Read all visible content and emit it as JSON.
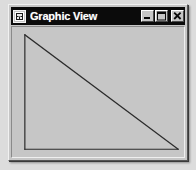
{
  "page": {
    "background_color": "#dcdcdc",
    "width": 196,
    "height": 170
  },
  "window": {
    "title": "Graphic View",
    "icon": "application-icon",
    "frame_color": "#c6c6c6",
    "titlebar_color": "#0b0b0b",
    "titlebar_text_color": "#ffffff",
    "state": "restored",
    "controls": [
      {
        "name": "minimize",
        "label": "_",
        "tooltip": "Minimize"
      },
      {
        "name": "maximize",
        "label": "□",
        "tooltip": "Maximize"
      },
      {
        "name": "close",
        "label": "✕",
        "tooltip": "Close"
      }
    ]
  },
  "client": {
    "background_color": "#c6c6c6",
    "stroke_color": "#2b2b2b",
    "stroke_width": 1.2
  },
  "chart_data": {
    "type": "line",
    "title": "",
    "xlabel": "",
    "ylabel": "",
    "grid": false,
    "legend": null,
    "xlim": [
      0,
      174
    ],
    "ylim": [
      0,
      134
    ],
    "shapes": [
      {
        "name": "left-leg",
        "kind": "segment",
        "points": [
          [
            13,
            8
          ],
          [
            13,
            126
          ]
        ]
      },
      {
        "name": "bottom-leg",
        "kind": "segment",
        "points": [
          [
            13,
            126
          ],
          [
            168,
            126
          ]
        ]
      },
      {
        "name": "hypotenuse",
        "kind": "segment",
        "points": [
          [
            13,
            8
          ],
          [
            168,
            126
          ]
        ]
      }
    ],
    "series": [
      {
        "name": "triangle-outline",
        "x": [
          13,
          13,
          168,
          13
        ],
        "y": [
          8,
          126,
          126,
          8
        ]
      }
    ]
  }
}
